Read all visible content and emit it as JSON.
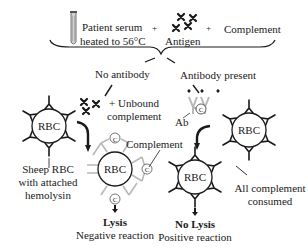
{
  "top": {
    "serum_line1": "Patient serum",
    "serum_line2": "heated to 56°C",
    "plus1": "+",
    "antigen": "Antigen",
    "plus2": "+",
    "complement": "Complement"
  },
  "branches": {
    "left": "No antibody",
    "right": "Antibody present"
  },
  "left_path": {
    "unbound_line1": "+ Unbound",
    "unbound_line2": "complement",
    "complement_label": "Complement",
    "sheep_line1": "Sheep RBC",
    "sheep_line2": "with attached",
    "sheep_line3": "hemolysin",
    "result_title": "Lysis",
    "result_sub": "Negative reaction"
  },
  "right_path": {
    "ab_label": "Ab",
    "consumed_line1": "All complement",
    "consumed_line2": "consumed",
    "result_title": "No Lysis",
    "result_sub": "Positive reaction"
  },
  "rbc_label": "RBC",
  "complement_symbol": "C",
  "colors": {
    "ink": "#1a1a1a",
    "faded": "#b8b8b8",
    "tube": "#888888"
  }
}
